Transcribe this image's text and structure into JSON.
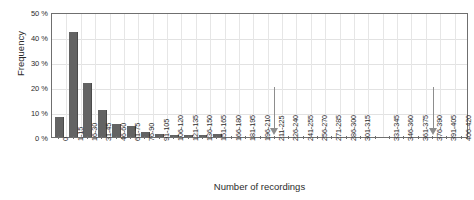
{
  "chart_data": {
    "type": "bar",
    "title": "",
    "xlabel": "Number of recordings",
    "ylabel": "Frequency",
    "ylim": [
      0,
      50
    ],
    "yticks": [
      0,
      10,
      20,
      30,
      40,
      50
    ],
    "ytick_labels": [
      "0 %",
      "10 %",
      "20 %",
      "30 %",
      "40 %",
      "50 %"
    ],
    "grid": true,
    "legend": "none",
    "bar_color": "#636363",
    "categories": [
      "0",
      "1-15",
      "16-30",
      "31-45",
      "46-60",
      "61-75",
      "76-90",
      "91-105",
      "106-120",
      "121-135",
      "136-150",
      "151-165",
      "166-180",
      "181-195",
      "196-210",
      "211-225",
      "226-240",
      "241-255",
      "256-270",
      "271-285",
      "286-300",
      "301-315",
      "316-330",
      "331-345",
      "346-360",
      "361-375",
      "376-390",
      "391-405",
      "406-420"
    ],
    "tick_labels_shown": [
      "0",
      "1-15",
      "16-30",
      "31-45",
      "46-60",
      "61-75",
      "76-90",
      "91-105",
      "106-120",
      "121-135",
      "136-150",
      "151-165",
      "166-180",
      "181-195",
      "196-210",
      "211-225",
      "226-240",
      "241-255",
      "256-270",
      "271-285",
      "286-300",
      "301-315",
      "",
      "331-345",
      "346-360",
      "361-375",
      "376-390",
      "391-405",
      "406-420"
    ],
    "values": [
      8.0,
      42.2,
      21.5,
      11.0,
      5.2,
      4.6,
      2.2,
      1.2,
      1.0,
      1.0,
      1.0,
      1.2,
      0.0,
      0.0,
      0.0,
      0.0,
      0.0,
      0.0,
      0.0,
      0.0,
      0.0,
      0.0,
      0.0,
      0.0,
      0.0,
      0.0,
      0.0,
      0.0,
      0.0
    ],
    "annotations": [
      {
        "name": "arrow-marker-1",
        "glyph": "down-arrow",
        "category": "211-225",
        "index": 15
      },
      {
        "name": "arrow-marker-2",
        "glyph": "down-arrow",
        "category": "376-390",
        "index": 26
      }
    ],
    "annotation_color": "#8d8d8d"
  }
}
